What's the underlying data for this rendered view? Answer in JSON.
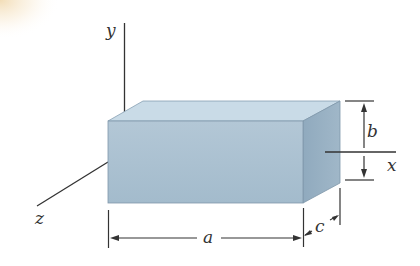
{
  "diagram": {
    "type": "rectangular-prism-with-axes",
    "axes": {
      "y_label": "y",
      "x_label": "x",
      "z_label": "z"
    },
    "dimensions": {
      "length_label": "a",
      "height_label": "b",
      "depth_label": "c"
    },
    "colors": {
      "front_face": "#a9bfcf",
      "top_face": "#c8dae6",
      "side_face": "#8fa9bd",
      "edge": "#7f97aa",
      "line": "#333333",
      "corner_glow": "#f4e2c0"
    }
  }
}
